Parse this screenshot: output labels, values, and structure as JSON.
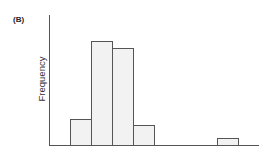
{
  "panel_label": "(B)",
  "chart_data": {
    "type": "bar",
    "title": "",
    "xlabel": "",
    "ylabel": "Frequency",
    "categories": [
      "bin1",
      "bin2",
      "bin3",
      "bin4",
      "bin5",
      "bin6",
      "bin7",
      "bin8"
    ],
    "values": [
      26,
      104,
      97,
      20,
      0,
      0,
      0,
      7
    ],
    "ylim": [
      0,
      130
    ],
    "grid": false,
    "legend": null,
    "bar_fill": "#f2f2f2",
    "bar_edge": "#555555",
    "tick_labels_shown": false
  }
}
